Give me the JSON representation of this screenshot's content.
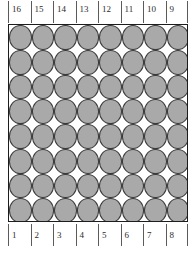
{
  "figure": {
    "name": "circle-packing-diagram",
    "box": {
      "columns": 8,
      "rows": 8,
      "circle_count": 64,
      "packing": "square",
      "circle_fill": "#a9a9a9",
      "circle_stroke": "#3a3a3a",
      "border_color": "#1d1d1d",
      "background": "#ffffff"
    },
    "top_axis": {
      "labels": [
        "16",
        "15",
        "14",
        "13",
        "12",
        "11",
        "10",
        "9"
      ]
    },
    "bottom_axis": {
      "labels": [
        "1",
        "2",
        "3",
        "4",
        "5",
        "6",
        "7",
        "8"
      ]
    },
    "caption": ""
  }
}
